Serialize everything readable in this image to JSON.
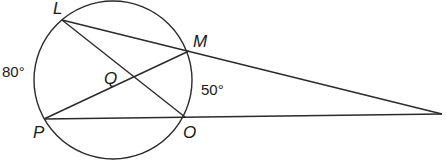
{
  "diagram": {
    "type": "geometry-circle-secants",
    "circle": {
      "cx": 113,
      "cy": 80,
      "r": 79
    },
    "points": {
      "L": {
        "label": "L",
        "x": 62,
        "y": 20
      },
      "M": {
        "label": "M",
        "x": 189,
        "y": 51
      },
      "P": {
        "label": "P",
        "x": 44,
        "y": 119
      },
      "O": {
        "label": "O",
        "x": 185,
        "y": 117
      },
      "Q": {
        "label": "Q",
        "x": 133,
        "y": 79
      },
      "external": {
        "x": 442,
        "y": 114
      }
    },
    "arcs": {
      "LP": {
        "label": "80°"
      },
      "MO": {
        "label": "50°"
      }
    },
    "segments": [
      "L-O",
      "P-M",
      "L-external",
      "P-external"
    ],
    "line_color": "#2a2a2a"
  }
}
